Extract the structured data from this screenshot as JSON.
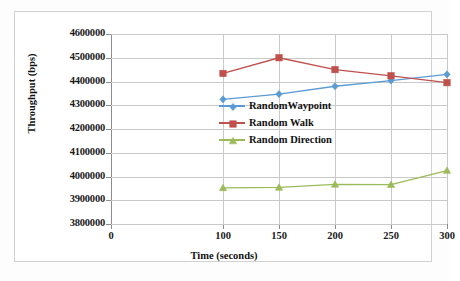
{
  "chart_data": {
    "type": "line",
    "title": "",
    "xlabel": "Time (seconds)",
    "ylabel": "Throughput (bps)",
    "x": [
      100,
      150,
      200,
      250,
      300
    ],
    "xtick_labels": [
      "0",
      "100",
      "150",
      "200",
      "250",
      "300"
    ],
    "xtick_values": [
      0,
      100,
      150,
      200,
      250,
      300
    ],
    "xlim": [
      0,
      300
    ],
    "ylim": [
      3800000,
      4600000
    ],
    "ytick_labels": [
      "4600000",
      "4500000",
      "4400000",
      "4300000",
      "4200000",
      "4100000",
      "4000000",
      "3900000",
      "3800000"
    ],
    "ytick_values": [
      4600000,
      4500000,
      4400000,
      4300000,
      4200000,
      4100000,
      4000000,
      3900000,
      3800000
    ],
    "grid": true,
    "legend_position": "center-right",
    "series": [
      {
        "name": "RandomWaypoint",
        "color": "#5b9bd5",
        "marker": "diamond",
        "values": [
          4325000,
          4347000,
          4380000,
          4404000,
          4430000
        ]
      },
      {
        "name": "Random Walk",
        "color": "#c0504d",
        "marker": "square",
        "values": [
          4434000,
          4500000,
          4450000,
          4424000,
          4395000
        ]
      },
      {
        "name": "Random Direction",
        "color": "#9bbb59",
        "marker": "triangle",
        "values": [
          3952000,
          3954000,
          3967000,
          3966000,
          4025000
        ]
      }
    ]
  },
  "axes": {
    "x_title": "Time (seconds)",
    "y_title": "Throughput (bps)"
  },
  "legend": {
    "items": [
      {
        "label": "RandomWaypoint"
      },
      {
        "label": "Random Walk"
      },
      {
        "label": "Random Direction"
      }
    ]
  },
  "colors": {
    "series1": "#5b9bd5",
    "series2": "#c0504d",
    "series3": "#9bbb59",
    "grid": "#c9c9c9",
    "axis": "#8d8d8d",
    "frame": "#d2d2d2",
    "text": "#111111"
  }
}
